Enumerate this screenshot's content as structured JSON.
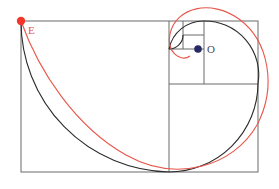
{
  "figure": {
    "background_color": "#ffffff",
    "width": 279,
    "height": 189
  },
  "labels": {
    "point_e": "E",
    "point_o": "O"
  },
  "colors": {
    "grid_stroke": "#6b6b6b",
    "black_spiral": "#2b2b2b",
    "red_spiral": "#e8564a",
    "point_e_fill": "#f2372a",
    "point_o_fill": "#252a63"
  },
  "points": {
    "E": {
      "x": 21,
      "y": 21,
      "radius": 4.2,
      "label_x": 28,
      "label_y": 30
    },
    "O": {
      "x": 198,
      "y": 49,
      "radius": 3.8,
      "label_x": 207,
      "label_y": 49
    }
  },
  "geometry": {
    "outer_rect": {
      "x": 21,
      "y": 21,
      "width": 237,
      "height": 151
    },
    "divider_lines": [
      {
        "name": "main-vertical-divider",
        "x1": 169,
        "y1": 21,
        "x2": 169,
        "y2": 172
      },
      {
        "name": "upper-horizontal-divider",
        "x1": 169,
        "y1": 84,
        "x2": 258,
        "y2": 84
      },
      {
        "name": "square-vertical-divider",
        "x1": 204,
        "y1": 21,
        "x2": 204,
        "y2": 84
      },
      {
        "name": "small-horizontal-divider",
        "x1": 169,
        "y1": 49,
        "x2": 204,
        "y2": 49
      },
      {
        "name": "tiny-vertical-divider",
        "x1": 183,
        "y1": 21,
        "x2": 183,
        "y2": 49
      },
      {
        "name": "tiny-horizontal-divider",
        "x1": 183,
        "y1": 35,
        "x2": 204,
        "y2": 35
      }
    ],
    "black_spiral_arcs": [
      {
        "name": "arc-large",
        "path": "M 21 21 A 151 151 0 0 0 169 172"
      },
      {
        "name": "arc-medium",
        "path": "M 169 172 A 89 89 0 0 0 258 84"
      },
      {
        "name": "arc-small",
        "path": "M 258 84 A 54 54 0 0 0 204 21"
      },
      {
        "name": "arc-tiny",
        "path": "M 204 21 A 35 35 0 0 0 169 49"
      },
      {
        "name": "arc-micro",
        "path": "M 169 49 A 14 14 0 0 0 183 35"
      }
    ],
    "red_spiral_path": "M 21 21 C 40 70, 75 125, 125 155 C 175 184, 232 168, 257 126 C 278 88, 270 42, 240 19 C 212 -2, 177 6, 170 33 C 165 51, 180 62, 189 56"
  },
  "icon_names": {
    "point_marker_e": "red-dot-marker",
    "point_marker_o": "blue-dot-marker"
  }
}
